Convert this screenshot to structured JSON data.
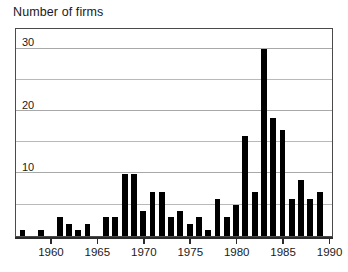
{
  "chart_data": {
    "type": "bar",
    "title": "Number of firms",
    "xlabel": "",
    "ylabel": "Number of firms",
    "ylim": [
      0,
      33
    ],
    "xlim": [
      1956.3,
      1990.2
    ],
    "grid": true,
    "grid_interval": 5,
    "legend": "none",
    "y_tick_labels": [
      "10",
      "20",
      "30"
    ],
    "y_tick_values": [
      10,
      20,
      30
    ],
    "y_gridline_values": [
      5,
      10,
      15,
      20,
      25,
      30
    ],
    "x_tick_labels": [
      "1960",
      "1965",
      "1970",
      "1975",
      "1980",
      "1985",
      "1990"
    ],
    "x_tick_values": [
      1960,
      1965,
      1970,
      1975,
      1980,
      1985,
      1990
    ],
    "categories": [
      1957,
      1958,
      1959,
      1960,
      1961,
      1962,
      1963,
      1964,
      1965,
      1966,
      1967,
      1968,
      1969,
      1970,
      1971,
      1972,
      1973,
      1974,
      1975,
      1976,
      1977,
      1978,
      1979,
      1980,
      1981,
      1982,
      1983,
      1984,
      1985,
      1986,
      1987,
      1988,
      1989
    ],
    "values": [
      1,
      0,
      1,
      0,
      3,
      2,
      1,
      2,
      0,
      3,
      3,
      10,
      10,
      4,
      7,
      7,
      3,
      4,
      2,
      3,
      1,
      6,
      3,
      5,
      16,
      7,
      30,
      19,
      17,
      6,
      9,
      6,
      7
    ],
    "bar_color": "#000000"
  },
  "axis": {
    "y_title": "Number of firms"
  }
}
